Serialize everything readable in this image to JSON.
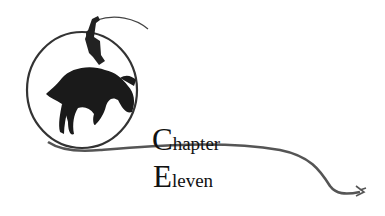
{
  "heading": {
    "line1": {
      "cap": "C",
      "rest": "hapter"
    },
    "line2": {
      "cap": "E",
      "rest": "leven"
    }
  },
  "illustration": {
    "subject": "bucking-bronco-rider-with-lasso-icon"
  },
  "colors": {
    "ink": "#111111",
    "rope": "#555555",
    "background": "#ffffff"
  }
}
